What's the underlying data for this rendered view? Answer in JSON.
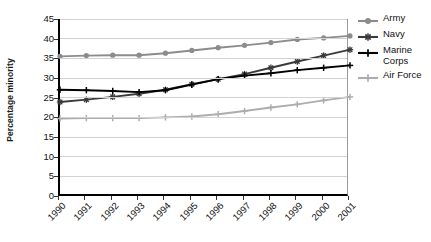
{
  "chart_data": {
    "type": "line",
    "title": "",
    "xlabel": "",
    "ylabel": "Percentage minority",
    "categories": [
      "1990",
      "1991",
      "1992",
      "1993",
      "1994",
      "1995",
      "1996",
      "1997",
      "1998",
      "1999",
      "2000",
      "2001"
    ],
    "ylim": [
      0,
      45
    ],
    "yticks": [
      0,
      5,
      10,
      15,
      20,
      25,
      30,
      35,
      40,
      45
    ],
    "grid": true,
    "legend_position": "right",
    "series": [
      {
        "name": "Army",
        "marker": "circle",
        "color": "#8c8c8c",
        "values": [
          35.5,
          35.7,
          35.8,
          35.8,
          36.3,
          37.0,
          37.7,
          38.3,
          39.0,
          39.8,
          40.2,
          40.7
        ]
      },
      {
        "name": "Navy",
        "marker": "asterisk",
        "color": "#3a3a3a",
        "values": [
          23.9,
          24.5,
          25.2,
          26.0,
          27.0,
          28.4,
          29.7,
          31.0,
          32.6,
          34.2,
          35.7,
          37.2
        ]
      },
      {
        "name": "Marine Corps",
        "marker": "plus",
        "color": "#000000",
        "values": [
          27.0,
          26.9,
          26.7,
          26.4,
          26.9,
          28.3,
          29.7,
          30.6,
          31.2,
          32.0,
          32.6,
          33.2
        ]
      },
      {
        "name": "Air Force",
        "marker": "plus",
        "color": "#adadad",
        "values": [
          19.7,
          19.8,
          19.8,
          19.8,
          20.0,
          20.2,
          20.8,
          21.6,
          22.5,
          23.3,
          24.3,
          25.2
        ]
      }
    ]
  },
  "legend": {
    "entries": [
      {
        "label": "Army"
      },
      {
        "label": "Navy"
      },
      {
        "label": "Marine Corps"
      },
      {
        "label": "Air Force"
      }
    ]
  }
}
